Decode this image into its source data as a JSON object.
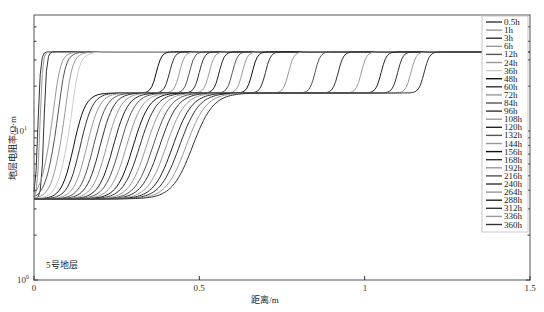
{
  "chart_data": {
    "type": "line",
    "title": "",
    "xlabel": "距离/m",
    "ylabel": "地层电阻率/Ω·m",
    "xlim": [
      0,
      1.5
    ],
    "ylim": [
      1,
      60
    ],
    "yscale": "log",
    "x_ticks": [
      "0",
      "0.5",
      "1",
      "1.5"
    ],
    "y_ticks": [
      "10^0",
      "10^1"
    ],
    "grid": false,
    "legend_position": "upper right (inside)",
    "annotation": "5号地层",
    "levels_ohm_m": {
      "base": 3.5,
      "middle_plateau": 18,
      "top_plateau": 34
    },
    "series": [
      {
        "name": "0.5h",
        "color": "#333333",
        "invasion_front_m": 0.012,
        "outer_front_m": 0.0
      },
      {
        "name": "1h",
        "color": "#999999",
        "invasion_front_m": 0.018,
        "outer_front_m": 0.0
      },
      {
        "name": "3h",
        "color": "#333333",
        "invasion_front_m": 0.03,
        "outer_front_m": 0.0
      },
      {
        "name": "6h",
        "color": "#999999",
        "invasion_front_m": 0.045,
        "outer_front_m": 0.03
      },
      {
        "name": "12h",
        "color": "#555555",
        "invasion_front_m": 0.06,
        "outer_front_m": 0.06
      },
      {
        "name": "24h",
        "color": "#999999",
        "invasion_front_m": 0.08,
        "outer_front_m": 0.09
      },
      {
        "name": "36h",
        "color": "#cccccc",
        "invasion_front_m": 0.1,
        "outer_front_m": 0.12
      },
      {
        "name": "48h",
        "color": "#111111",
        "invasion_front_m": 0.12,
        "outer_front_m": 0.37
      },
      {
        "name": "60h",
        "color": "#333333",
        "invasion_front_m": 0.14,
        "outer_front_m": 0.41
      },
      {
        "name": "72h",
        "color": "#999999",
        "invasion_front_m": 0.16,
        "outer_front_m": 0.44
      },
      {
        "name": "84h",
        "color": "#555555",
        "invasion_front_m": 0.18,
        "outer_front_m": 0.47
      },
      {
        "name": "96h",
        "color": "#333333",
        "invasion_front_m": 0.2,
        "outer_front_m": 0.5
      },
      {
        "name": "108h",
        "color": "#999999",
        "invasion_front_m": 0.22,
        "outer_front_m": 0.53
      },
      {
        "name": "120h",
        "color": "#222222",
        "invasion_front_m": 0.24,
        "outer_front_m": 0.56
      },
      {
        "name": "132h",
        "color": "#555555",
        "invasion_front_m": 0.26,
        "outer_front_m": 0.6
      },
      {
        "name": "144h",
        "color": "#999999",
        "invasion_front_m": 0.28,
        "outer_front_m": 0.63
      },
      {
        "name": "156h",
        "color": "#111111",
        "invasion_front_m": 0.3,
        "outer_front_m": 0.66
      },
      {
        "name": "168h",
        "color": "#333333",
        "invasion_front_m": 0.32,
        "outer_front_m": 0.7
      },
      {
        "name": "192h",
        "color": "#999999",
        "invasion_front_m": 0.34,
        "outer_front_m": 0.77
      },
      {
        "name": "216h",
        "color": "#555555",
        "invasion_front_m": 0.36,
        "outer_front_m": 0.85
      },
      {
        "name": "240h",
        "color": "#333333",
        "invasion_front_m": 0.38,
        "outer_front_m": 0.92
      },
      {
        "name": "264h",
        "color": "#999999",
        "invasion_front_m": 0.4,
        "outer_front_m": 0.99
      },
      {
        "name": "288h",
        "color": "#222222",
        "invasion_front_m": 0.42,
        "outer_front_m": 1.05
      },
      {
        "name": "312h",
        "color": "#333333",
        "invasion_front_m": 0.44,
        "outer_front_m": 1.1
      },
      {
        "name": "336h",
        "color": "#999999",
        "invasion_front_m": 0.46,
        "outer_front_m": 1.14
      },
      {
        "name": "360h",
        "color": "#333333",
        "invasion_front_m": 0.48,
        "outer_front_m": 1.18
      }
    ]
  },
  "labels": {
    "y_tick_0_base": "10",
    "y_tick_0_exp": "0",
    "y_tick_1_base": "10",
    "y_tick_1_exp": "1",
    "x_tick_0": "0",
    "x_tick_05": "0.5",
    "x_tick_1": "1",
    "x_tick_15": "1.5",
    "xlabel": "距离/m",
    "ylabel": "地层电阻率/Ω·m",
    "annotation": "5号地层"
  }
}
